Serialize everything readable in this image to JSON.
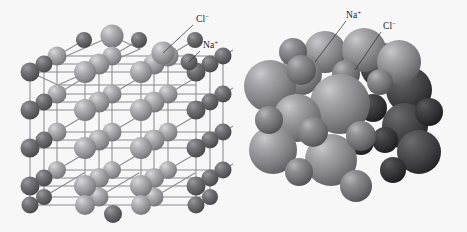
{
  "figure": {
    "background_color": "#f7f7f8",
    "panels": [
      {
        "id": "ball-and-stick",
        "name": "Ball-and-stick lattice model",
        "labels": [
          {
            "id": "cl",
            "text": "Cl",
            "charge": "−",
            "x": 196,
            "y": 22,
            "leader": {
              "x1": 193,
              "y1": 25,
              "x2": 163,
              "y2": 53
            }
          },
          {
            "id": "na",
            "text": "Na",
            "charge": "+",
            "x": 203,
            "y": 48,
            "leader": {
              "x1": 200,
              "y1": 51,
              "x2": 189,
              "y2": 62
            }
          }
        ]
      },
      {
        "id": "space-filling",
        "name": "Space-filling packing model",
        "labels": [
          {
            "id": "na",
            "text": "Na",
            "charge": "+",
            "x": 113,
            "y": 18,
            "leader": {
              "x1": 113,
              "y1": 21,
              "x2": 82,
              "y2": 62
            }
          },
          {
            "id": "cl",
            "text": "Cl",
            "charge": "−",
            "x": 150,
            "y": 29,
            "leader": {
              "x1": 148,
              "y1": 32,
              "x2": 122,
              "y2": 70
            }
          }
        ]
      }
    ],
    "ions": {
      "chloride": {
        "symbol": "Cl",
        "charge": "−",
        "label": "Cl−",
        "role": "larger anion",
        "ball_stick_color": "#9a9a9e",
        "space_fill_color": "#8e8e92"
      },
      "sodium": {
        "symbol": "Na",
        "charge": "+",
        "label": "Na+",
        "role": "smaller cation",
        "ball_stick_color": "#5f5f63",
        "space_fill_color": "#6b6b70"
      }
    },
    "bond_color": "#8c8c90",
    "leader_color": "#2a2a2e"
  }
}
